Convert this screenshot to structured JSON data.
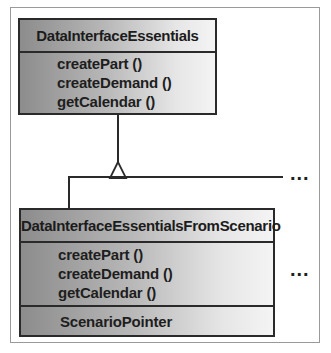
{
  "diagram": {
    "type": "uml-class-diagram",
    "parent_class": {
      "name": "DataInterfaceEssentials",
      "operations": [
        "createPart  ()",
        "createDemand  ()",
        "getCalendar  ()"
      ]
    },
    "child_class": {
      "name": "DataInterfaceEssentialsFromScenario",
      "operations": [
        "createPart  ()",
        "createDemand  ()",
        "getCalendar  ()"
      ],
      "attributes": [
        "ScenarioPointer"
      ]
    },
    "relationship": {
      "kind": "generalization",
      "from": "DataInterfaceEssentialsFromScenario",
      "to": "DataInterfaceEssentials"
    },
    "continuation_markers": [
      "...",
      "..."
    ]
  }
}
